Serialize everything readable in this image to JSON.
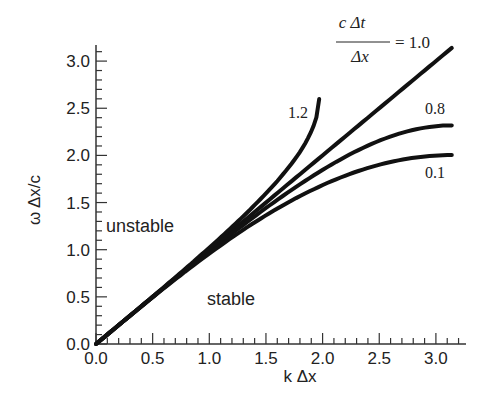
{
  "chart_data": {
    "type": "line",
    "title": "",
    "xlabel": "k Δx",
    "ylabel": "ω Δx/c",
    "xlim": [
      0,
      3.2
    ],
    "ylim": [
      0,
      3.2
    ],
    "grid": false,
    "x_ticks": [
      "0.0",
      "0.5",
      "1.0",
      "1.5",
      "2.0",
      "2.5",
      "3.0"
    ],
    "y_ticks": [
      "0.0",
      "0.5",
      "1.0",
      "1.5",
      "2.0",
      "2.5",
      "3.0"
    ],
    "legend_title": {
      "numerator": "c Δt",
      "denominator": "Δx",
      "equals": "= 1.0"
    },
    "series": [
      {
        "name": "1.0",
        "label": "= 1.0",
        "x": [
          0,
          0.5,
          1.0,
          1.5,
          2.0,
          2.5,
          3.0,
          3.14
        ],
        "y": [
          0,
          0.5,
          1.0,
          1.5,
          2.0,
          2.5,
          3.0,
          3.14
        ]
      },
      {
        "name": "1.2",
        "label": "1.2",
        "x": [
          0,
          0.5,
          1.0,
          1.5,
          1.8,
          1.9,
          1.95,
          1.97
        ],
        "y": [
          0,
          0.502,
          1.021,
          1.597,
          2.038,
          2.253,
          2.42,
          2.57
        ]
      },
      {
        "name": "0.8",
        "label": "0.8",
        "x": [
          0,
          0.5,
          1.0,
          1.5,
          2.0,
          2.5,
          3.0,
          3.14
        ],
        "y": [
          0,
          0.498,
          0.984,
          1.442,
          1.846,
          2.157,
          2.31,
          2.318
        ]
      },
      {
        "name": "0.1",
        "label": "0.1",
        "x": [
          0,
          0.5,
          1.0,
          1.5,
          2.0,
          2.5,
          3.0,
          3.14
        ],
        "y": [
          0,
          0.495,
          0.96,
          1.365,
          1.686,
          1.904,
          2.0,
          2.003
        ]
      }
    ],
    "annotations": [
      {
        "text": "unstable",
        "x": 0.1,
        "y": 1.22
      },
      {
        "text": "stable",
        "x": 1.0,
        "y": 0.42
      }
    ]
  },
  "labels": {
    "unstable": "unstable",
    "stable": "stable",
    "xlabel": "k Δx",
    "ylabel": "ω Δx/c",
    "formula_num": "c Δt",
    "formula_den": "Δx",
    "formula_eq": "= 1.0",
    "c12": "1.2",
    "c08": "0.8",
    "c01": "0.1"
  }
}
